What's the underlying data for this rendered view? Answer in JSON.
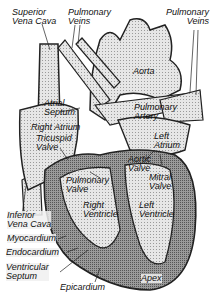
{
  "diagram": {
    "labels": {
      "superior_vena_cava": [
        "Superior",
        "Vena Cava"
      ],
      "pulmonary_veins_left": [
        "Pulmonary",
        "Veins"
      ],
      "pulmonary_veins_right": [
        "Pulmonary",
        "Veins"
      ],
      "aorta": [
        "Aorta"
      ],
      "atrial_septum": [
        "Atrial",
        "Septum"
      ],
      "right_atrium": [
        "Right Atrium"
      ],
      "tricuspid_valve": [
        "Tricuspid",
        "Valve"
      ],
      "pulmonary_artery": [
        "Pulmonary",
        "Artery"
      ],
      "left_atrium": [
        "Left",
        "Atrium"
      ],
      "pulmonary_valve": [
        "Pulmonary",
        "Valve"
      ],
      "aortic_valve": [
        "Aortic",
        "Valve"
      ],
      "mitral_valve": [
        "Mitral",
        "Valve"
      ],
      "right_ventricle": [
        "Right",
        "Ventricle"
      ],
      "left_ventricle": [
        "Left",
        "Ventricle"
      ],
      "inferior_vena_cava": [
        "Inferior",
        "Vena Cava"
      ],
      "myocardium": [
        "Myocardium"
      ],
      "endocardium": [
        "Endocardium"
      ],
      "ventricular_septum": [
        "Ventricular",
        "Septum"
      ],
      "epicardium": [
        "Epicardium"
      ],
      "apex": [
        "Apex"
      ]
    },
    "colors": {
      "chamber_fill": "#d4d4d4",
      "muscle_fill": "#8a8a8a",
      "outline": "#222222",
      "background": "#ffffff"
    }
  }
}
